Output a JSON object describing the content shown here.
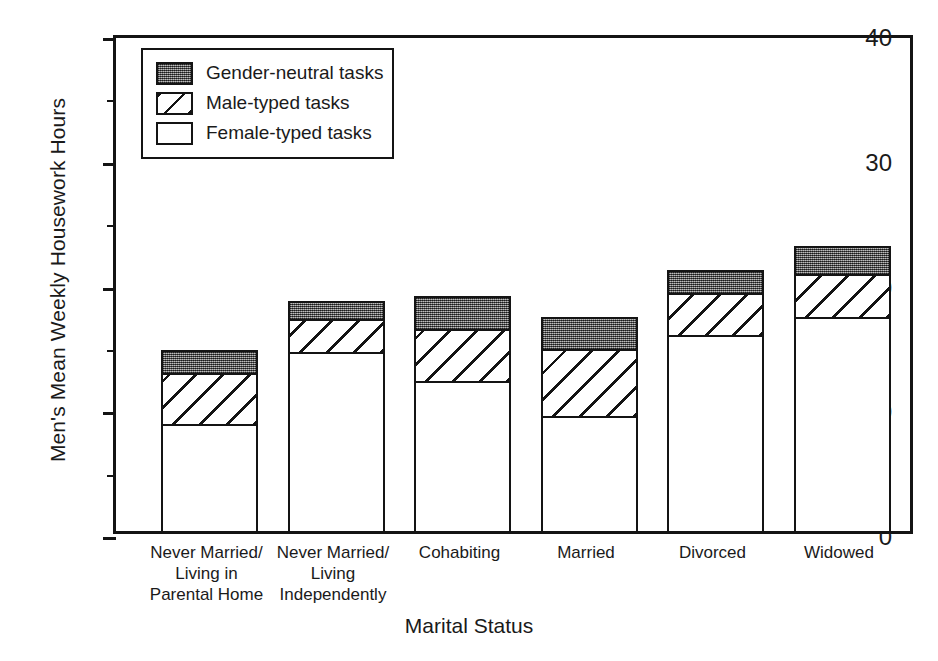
{
  "chart_data": {
    "type": "bar",
    "subtype": "stacked-vertical",
    "title": "",
    "xlabel": "Marital Status",
    "ylabel": "Men's Mean Weekly Housework Hours",
    "ylim": [
      0,
      40
    ],
    "yticks": [
      0,
      10,
      20,
      30,
      40
    ],
    "ytick_labels": [
      "0",
      "10",
      "20",
      "30",
      "40"
    ],
    "yticks_minor": [
      5,
      15,
      25,
      35
    ],
    "grid": false,
    "legend_position": "upper-left-inside",
    "categories": [
      "Never Married/\nLiving in\nParental Home",
      "Never Married/\nLiving\nIndependently",
      "Cohabiting",
      "Married",
      "Divorced",
      "Widowed"
    ],
    "series": [
      {
        "name": "Female-typed tasks",
        "pattern": "white-fill",
        "values": [
          8.7,
          14.5,
          12.2,
          9.4,
          15.9,
          17.3
        ]
      },
      {
        "name": "Male-typed tasks",
        "pattern": "diagonal-hatch",
        "values": [
          4.3,
          2.8,
          4.3,
          5.5,
          3.5,
          3.6
        ]
      },
      {
        "name": "Gender-neutral tasks",
        "pattern": "dark-stipple",
        "values": [
          2.0,
          1.6,
          2.8,
          2.7,
          2.0,
          2.4
        ]
      }
    ],
    "totals": [
      15.0,
      18.9,
      19.3,
      17.6,
      21.4,
      23.3
    ],
    "colors": {
      "axis": "#141414",
      "female_typed": "#ffffff",
      "male_typed": "#ffffff",
      "gender_neutral": "#6e6e6e"
    }
  },
  "legend": {
    "items": [
      {
        "label": "Gender-neutral tasks",
        "pattern": "neutral"
      },
      {
        "label": "Male-typed tasks",
        "pattern": "male"
      },
      {
        "label": "Female-typed tasks",
        "pattern": "female"
      }
    ]
  }
}
